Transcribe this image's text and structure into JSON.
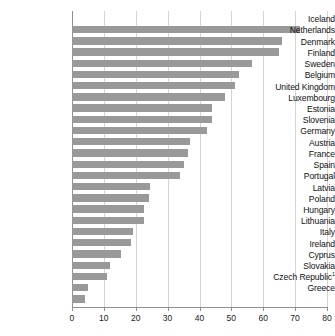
{
  "chart_data": {
    "type": "bar",
    "orientation": "horizontal",
    "title": "",
    "xlabel": "",
    "ylabel": "",
    "xlim": [
      0,
      80
    ],
    "xticks": [
      0,
      10,
      20,
      30,
      40,
      50,
      60,
      70,
      80
    ],
    "grid": true,
    "legend": null,
    "bar_color": "#999999",
    "categories": [
      "Iceland",
      "Netherlands",
      "Denmark",
      "Finland",
      "Sweden",
      "Belgium",
      "United Kingdom",
      "Luxembourg",
      "Estonia",
      "Slovenia",
      "Germany",
      "Austria",
      "France",
      "Spain",
      "Portugal",
      "Latvia",
      "Poland",
      "Hungary",
      "Lithuania",
      "Italy",
      "Ireland",
      "Cyprus",
      "Slovakia",
      "Czech Republic",
      "Greece"
    ],
    "category_footnotes": {
      "Czech Republic": "1"
    },
    "values": [
      71.5,
      66.0,
      65.0,
      56.5,
      52.5,
      51.0,
      48.0,
      44.0,
      44.0,
      42.5,
      37.0,
      36.5,
      35.0,
      34.0,
      24.5,
      24.0,
      22.5,
      22.5,
      19.0,
      18.5,
      15.5,
      12.0,
      11.0,
      5.0,
      4.0
    ]
  }
}
